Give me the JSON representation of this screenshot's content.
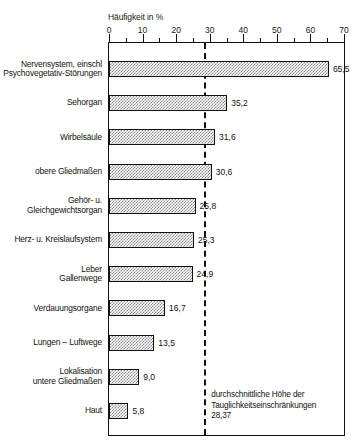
{
  "chart_data": {
    "type": "bar",
    "orientation": "horizontal",
    "title": "",
    "xlabel": "Häufigkeit in %",
    "ylabel": "",
    "xlim": [
      0,
      70
    ],
    "xticks": [
      0,
      10,
      20,
      30,
      40,
      50,
      60,
      70
    ],
    "xtick_labels": [
      "0",
      "10",
      "20",
      "30",
      "40",
      "50",
      "60",
      "70"
    ],
    "minor_tick_step": 5,
    "grid": false,
    "legend": "none",
    "categories": [
      "Nervensystem, einschl\nPsychovegetativ-Störungen",
      "Sehorgan",
      "Wirbelsäule",
      "obere Gliedmaßen",
      "Gehör- u.\nGleichgewichtsorgan",
      "Herz- u. Kreislaufsystem",
      "Leber\nGallenwege",
      "Verdauungsorgane",
      "Lungen – Luftwege",
      "Lokalisation\nuntere Gliedmaßen",
      "Haut"
    ],
    "values": [
      65.5,
      35.2,
      31.6,
      30.6,
      25.8,
      25.3,
      24.9,
      16.7,
      13.5,
      9.0,
      5.8
    ],
    "value_labels": [
      "65,5",
      "35,2",
      "31,6",
      "30,6",
      "25,8",
      "25,3",
      "24,9",
      "16,7",
      "13,5",
      "9,0",
      "5,8"
    ],
    "reference_line": {
      "value": 28.37,
      "style": "dashed",
      "label_lines": [
        "durchschnittliche Höhe der",
        "Tauglichkeitseinschränkungen",
        "28,37"
      ]
    },
    "colors": {
      "bar_fill": "#8d8d8d",
      "bar_edge": "#111111",
      "axis": "#111111",
      "text": "#111111",
      "background": "#ffffff"
    }
  },
  "rows": [
    {
      "label_lines": [
        "Nervensystem, einschl",
        "Psychovegetativ-Störungen"
      ],
      "value": 65.5,
      "value_label": "65,5"
    },
    {
      "label_lines": [
        "Sehorgan"
      ],
      "value": 35.2,
      "value_label": "35,2"
    },
    {
      "label_lines": [
        "Wirbelsäule"
      ],
      "value": 31.6,
      "value_label": "31,6"
    },
    {
      "label_lines": [
        "obere Gliedmaßen"
      ],
      "value": 30.6,
      "value_label": "30,6"
    },
    {
      "label_lines": [
        "Gehör- u.",
        "Gleichgewichtsorgan"
      ],
      "value": 25.8,
      "value_label": "25,8"
    },
    {
      "label_lines": [
        "Herz- u. Kreislaufsystem"
      ],
      "value": 25.3,
      "value_label": "25,3"
    },
    {
      "label_lines": [
        "Leber",
        "Gallenwege"
      ],
      "value": 24.9,
      "value_label": "24,9"
    },
    {
      "label_lines": [
        "Verdauungsorgane"
      ],
      "value": 16.7,
      "value_label": "16,7"
    },
    {
      "label_lines": [
        "Lungen – Luftwege"
      ],
      "value": 13.5,
      "value_label": "13,5"
    },
    {
      "label_lines": [
        "Lokalisation",
        "untere Gliedmaßen"
      ],
      "value": 9.0,
      "value_label": "9,0"
    },
    {
      "label_lines": [
        "Haut"
      ],
      "value": 5.8,
      "value_label": "5,8"
    }
  ]
}
